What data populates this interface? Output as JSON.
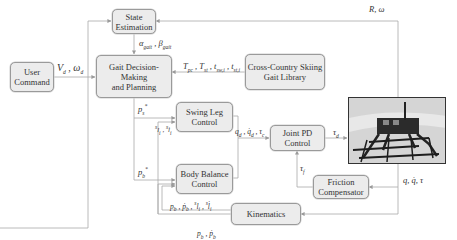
{
  "diagram": {
    "blocks": {
      "state_estimation": "State\nEstimation",
      "user_command": "User\nCommand",
      "gait_decision": "Gait Decision-Making\nand Planning",
      "gait_library": "Cross-Country Skiing\nGait Library",
      "swing_leg": "Swing Leg\nControl",
      "body_balance": "Body Balance\nControl",
      "joint_pd": "Joint PD\nControl",
      "friction": "Friction\nCompensator",
      "kinematics": "Kinematics"
    },
    "block_lines": {
      "state_estimation": [
        "State",
        "Estimation"
      ],
      "user_command": [
        "User",
        "Command"
      ],
      "gait_decision": [
        "Gait Decision-Making",
        "and Planning"
      ],
      "gait_library": [
        "Cross-Country Skiing",
        "Gait Library"
      ],
      "swing_leg": [
        "Swing Leg",
        "Control"
      ],
      "body_balance": [
        "Body Balance",
        "Control"
      ],
      "joint_pd": [
        "Joint PD",
        "Control"
      ],
      "friction": [
        "Friction",
        "Compensator"
      ],
      "kinematics": [
        "Kinematics"
      ]
    },
    "signals": {
      "r_omega": "R, ω",
      "v_omega_d": "V_d, ω_d",
      "alpha_beta": "α_gait, β_gait",
      "t_params": "T_pc, T_st, t_sw,i, t_st,i",
      "p_s_star": "p_s*",
      "s_l": "^s l_i, ^s l̇_i",
      "p_b_star": "p_b*",
      "q_d": "q_d, q̇_d, τ_c",
      "tau_d": "τ_d",
      "tau_f": "τ_f",
      "q_tau": "q, q̇, τ",
      "pb_l": "p_b, ṗ_b, ^s l_i, ^s l̇_i",
      "pb_pbdot": "p_b, ṗ_b"
    },
    "robot_image": "quadruped-robot-on-skis-photo",
    "colors": {
      "box_fill": "#ececec",
      "box_border": "#9a9a9a",
      "line": "#a8a8a8"
    }
  }
}
